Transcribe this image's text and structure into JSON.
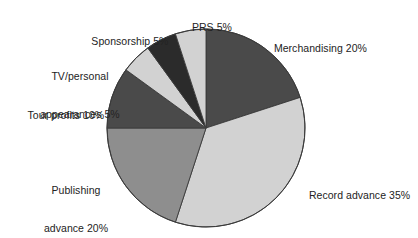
{
  "chart_data": {
    "type": "pie",
    "title": "",
    "subtitle": "",
    "xlabel": "",
    "ylabel": "",
    "legend_position": "none",
    "grid": false,
    "unit": "%",
    "start_angle_deg": 0,
    "direction": "clockwise",
    "categories": [
      "Merchandising",
      "Record advance",
      "Publishing advance",
      "Tour profits",
      "TV/personal appearances",
      "Sponsorship",
      "PRS"
    ],
    "values": [
      20,
      35,
      20,
      10,
      5,
      5,
      5
    ],
    "slices": [
      {
        "label": "Merchandising",
        "value": 20,
        "color": "#4a4a4a",
        "display": "Merchandising 20%"
      },
      {
        "label": "Record advance",
        "value": 35,
        "color": "#d2d2d2",
        "display": "Record advance 35%"
      },
      {
        "label": "Publishing advance",
        "value": 20,
        "color": "#8e8e8e",
        "display": "Publishing advance 20%"
      },
      {
        "label": "Tour profits",
        "value": 10,
        "color": "#4a4a4a",
        "display": "Tour profits 10%"
      },
      {
        "label": "TV/personal appearances",
        "value": 5,
        "color": "#d2d2d2",
        "display": "TV/personal appearances 5%"
      },
      {
        "label": "Sponsorship",
        "value": 5,
        "color": "#2b2b2b",
        "display": "Sponsorship 5%"
      },
      {
        "label": "PRS",
        "value": 5,
        "color": "#d2d2d2",
        "display": "PRS 5%"
      }
    ],
    "total": 100
  },
  "labels": {
    "prs": "PRS 5%",
    "sponsorship": "Sponsorship 5%",
    "tv_line1": "TV/personal",
    "tv_line2": "appearances 5%",
    "tour": "Tour profits 10%",
    "publishing_line1": "Publishing",
    "publishing_line2": "advance 20%",
    "record": "Record advance 35%",
    "merchandising": "Merchandising 20%"
  },
  "style": {
    "background": "#ffffff",
    "text_color": "#232323",
    "slice_stroke": "#3a3a3a"
  },
  "geometry": {
    "center_x": 206,
    "center_y": 128,
    "radius": 99
  }
}
